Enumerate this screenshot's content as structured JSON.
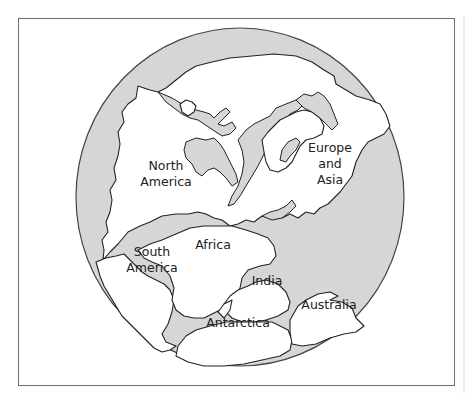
{
  "map": {
    "title": "Pangaea supercontinent",
    "colors": {
      "ocean": "#d6d6d6",
      "land": "#ffffff",
      "outline": "#222222",
      "frame": "#6e6e6e"
    },
    "labels": {
      "north_america": {
        "line1": "North",
        "line2": "America"
      },
      "europe_asia": {
        "line1": "Europe",
        "line2": "and",
        "line3": "Asia"
      },
      "south_america": {
        "line1": "South",
        "line2": "America"
      },
      "africa": {
        "line1": "Africa"
      },
      "india": {
        "line1": "India"
      },
      "australia": {
        "line1": "Australia"
      },
      "antarctica": {
        "line1": "Antarctica"
      }
    }
  }
}
